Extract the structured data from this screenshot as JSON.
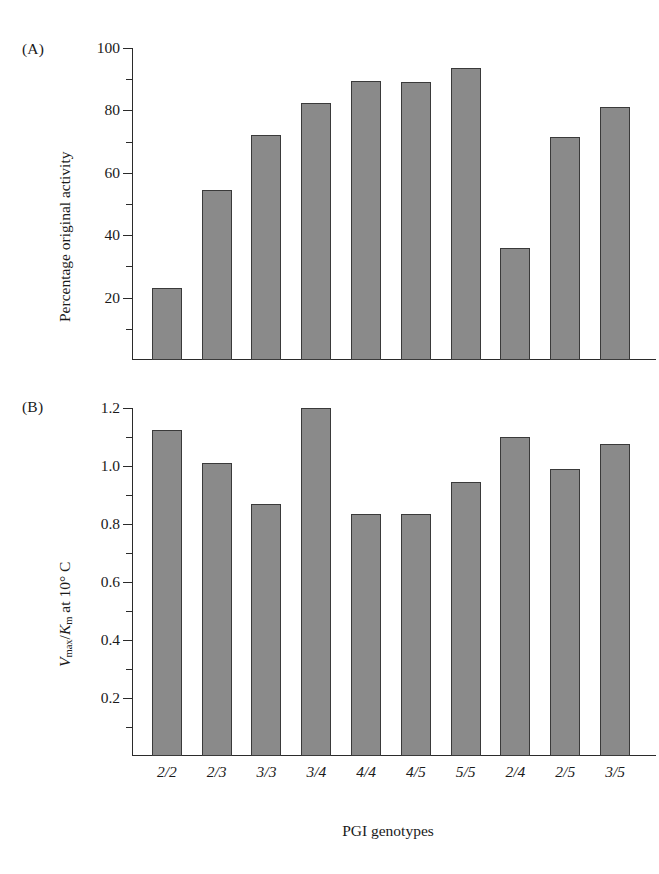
{
  "figure": {
    "top_caption_fragment": "",
    "panel_a_label": "(A)",
    "panel_b_label": "(B)",
    "bar_color": "#8a8a8a",
    "bar_outline_color": "#3a3a3a",
    "axis_color": "#2b2b2b"
  },
  "xaxis": {
    "title": "PGI genotypes",
    "categories": [
      "2/2",
      "2/3",
      "3/3",
      "3/4",
      "4/4",
      "4/5",
      "5/5",
      "2/4",
      "2/5",
      "3/5"
    ]
  },
  "panel_a": {
    "label": "(A)",
    "ylabel": "Percentage original activity",
    "ticks": [
      "100",
      "80",
      "60",
      "40",
      "20"
    ]
  },
  "panel_b": {
    "label": "(B)",
    "ylabel_prefix": "V",
    "ylabel_sub1": "max",
    "ylabel_mid": "/K",
    "ylabel_sub2": "m",
    "ylabel_suffix": " at 10° C",
    "ticks": [
      "1.2",
      "1.0",
      "0.8",
      "0.6",
      "0.4",
      "0.2"
    ]
  },
  "chart_data": [
    {
      "type": "bar",
      "panel": "(A)",
      "title": "",
      "xlabel": "PGI genotypes",
      "ylabel": "Percentage original activity",
      "categories": [
        "2/2",
        "2/3",
        "3/3",
        "3/4",
        "4/4",
        "4/5",
        "5/5",
        "2/4",
        "2/5",
        "3/5"
      ],
      "values": [
        23,
        54.5,
        72,
        82.5,
        89.5,
        89,
        93.5,
        36,
        71.5,
        81
      ],
      "ylim": [
        0,
        100
      ],
      "ytick_major": [
        20,
        40,
        60,
        80,
        100
      ],
      "ytick_minor_step": 10,
      "grid": false,
      "legend": null
    },
    {
      "type": "bar",
      "panel": "(B)",
      "title": "",
      "xlabel": "PGI genotypes",
      "ylabel": "Vmax/Km at 10° C",
      "categories": [
        "2/2",
        "2/3",
        "3/3",
        "3/4",
        "4/4",
        "4/5",
        "5/5",
        "2/4",
        "2/5",
        "3/5"
      ],
      "values": [
        1.125,
        1.01,
        0.87,
        1.2,
        0.835,
        0.835,
        0.945,
        1.1,
        0.99,
        1.075
      ],
      "ylim": [
        0,
        1.2
      ],
      "ytick_major": [
        0.2,
        0.4,
        0.6,
        0.8,
        1.0,
        1.2
      ],
      "ytick_minor_step": 0.1,
      "grid": false,
      "legend": null
    }
  ]
}
